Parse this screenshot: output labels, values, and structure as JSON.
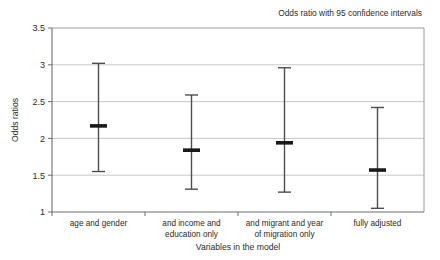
{
  "chart_data": {
    "type": "scatter",
    "title": "",
    "legend_text": "Odds ratio with 95 confidence intervals",
    "legend_position": "top-right",
    "xlabel": "Variables in the model",
    "ylabel": "Odds ratios",
    "ylim": [
      1,
      3.5
    ],
    "ytick_labels": [
      "1",
      "1.5",
      "2",
      "2.5",
      "3",
      "3.5"
    ],
    "ytick_values": [
      1,
      1.5,
      2,
      2.5,
      3,
      3.5
    ],
    "grid": true,
    "grid_axis": "y",
    "categories": [
      "age and gender",
      "and income and education only",
      "and migrant and year of migration only",
      "fully adjusted"
    ],
    "category_lines": [
      [
        "age and gender"
      ],
      [
        "and income and",
        "education only"
      ],
      [
        "and migrant and year",
        "of migration only"
      ],
      [
        "fully adjusted"
      ]
    ],
    "series": [
      {
        "name": "Odds ratio with 95 confidence intervals",
        "values": [
          2.17,
          1.84,
          1.94,
          1.57
        ],
        "ci_low": [
          1.55,
          1.31,
          1.27,
          1.05
        ],
        "ci_high": [
          3.02,
          2.59,
          2.96,
          2.42
        ]
      }
    ],
    "marker_color": "#1a1a1a",
    "line_color": "#4d4d4d",
    "grid_color": "#c8c8c8",
    "axis_color": "#808080",
    "plot_background": "#ffffff"
  }
}
